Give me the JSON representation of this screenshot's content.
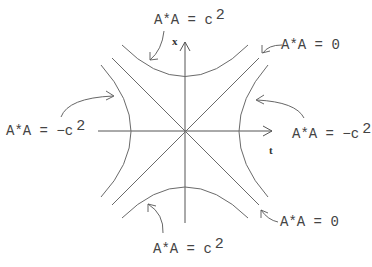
{
  "diagram": {
    "type": "spacetime-hyperbolas",
    "axes": {
      "horizontal_label": "t",
      "vertical_label": "x"
    },
    "labels": {
      "top": {
        "text": "A*A = c",
        "exponent": "2"
      },
      "bottom": {
        "text": "A*A = c",
        "exponent": "2"
      },
      "left": {
        "text": "A*A = −c",
        "exponent": "2"
      },
      "right": {
        "text": "A*A = −c",
        "exponent": "2"
      },
      "upper_right": {
        "text": "A*A = 0"
      },
      "lower_right": {
        "text": "A*A = 0"
      }
    },
    "curves": [
      {
        "name": "top-hyperbola",
        "meaning": "A*A = c^2"
      },
      {
        "name": "bottom-hyperbola",
        "meaning": "A*A = c^2"
      },
      {
        "name": "left-hyperbola",
        "meaning": "A*A = -c^2"
      },
      {
        "name": "right-hyperbola",
        "meaning": "A*A = -c^2"
      },
      {
        "name": "diagonal-light-cone-1",
        "meaning": "A*A = 0"
      },
      {
        "name": "diagonal-light-cone-2",
        "meaning": "A*A = 0"
      }
    ],
    "colors": {
      "line": "#6a6a6a",
      "text": "#444444"
    }
  }
}
